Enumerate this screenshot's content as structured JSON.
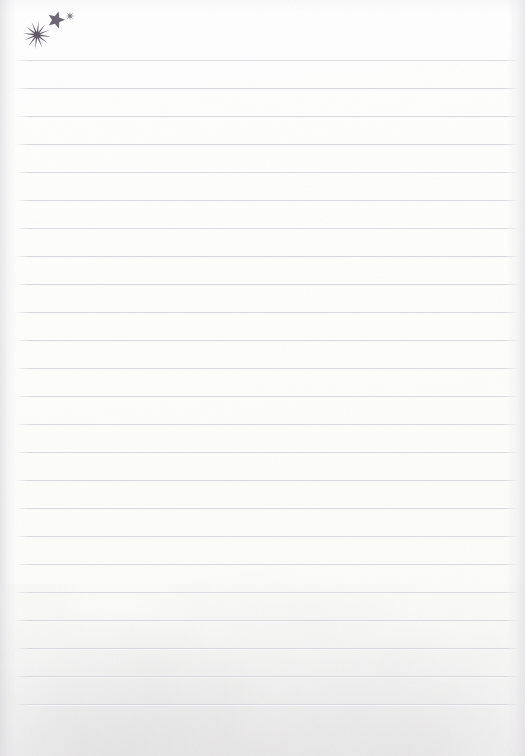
{
  "page": {
    "type": "lined-notebook-paper",
    "width": 525,
    "height": 756,
    "paper_color": "#fdfdfc",
    "background_color": "#ffffff",
    "title": "",
    "body_text": ""
  },
  "ruling": {
    "line_color": "#d6d6db",
    "line_thickness_px": 1,
    "line_spacing_px": 28,
    "first_line_y": 60,
    "line_count": 24,
    "line_start_x": 28,
    "line_end_x": 506,
    "line_y_positions": [
      60,
      88,
      116,
      144,
      172,
      200,
      228,
      256,
      284,
      312,
      340,
      368,
      396,
      424,
      452,
      480,
      508,
      536,
      564,
      592,
      620,
      648,
      676,
      704
    ]
  },
  "decoration": {
    "label": "stars-cluster",
    "color": "#6e6874",
    "items": [
      {
        "name": "starburst-icon",
        "shape": "starburst",
        "points": 12,
        "center_x": 37,
        "center_y": 35,
        "outer_radius": 14,
        "inner_radius": 3,
        "color": "#5f5a66"
      },
      {
        "name": "five-point-star-icon",
        "shape": "star",
        "points": 5,
        "center_x": 56,
        "center_y": 20,
        "outer_radius": 9,
        "inner_radius": 4,
        "color": "#6e6874"
      },
      {
        "name": "asterisk-star-icon",
        "shape": "asterisk",
        "points": 8,
        "center_x": 70,
        "center_y": 16,
        "outer_radius": 4.5,
        "inner_radius": 1.4,
        "color": "#827d88"
      }
    ]
  }
}
